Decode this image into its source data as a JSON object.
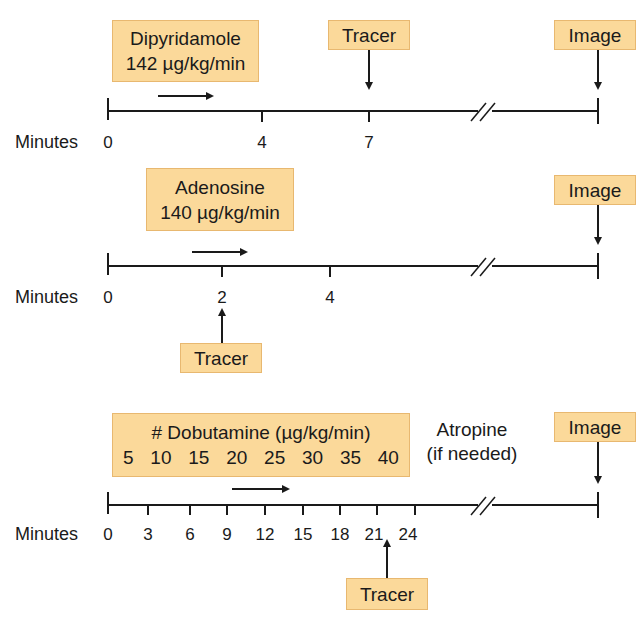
{
  "accent_colors": {
    "box_fill": "#fbd99a",
    "box_border": "#e8b870",
    "line": "#1a1a1a"
  },
  "panels": [
    {
      "name": "dipyridamole",
      "drug_box": {
        "line1": "Dipyridamole",
        "line2": "142 µg/kg/min"
      },
      "axis_label": "Minutes",
      "ticks": [
        "0",
        "4",
        "7"
      ],
      "tracer_label": "Tracer",
      "tracer_at_minute": "7",
      "image_label": "Image"
    },
    {
      "name": "adenosine",
      "drug_box": {
        "line1": "Adenosine",
        "line2": "140 µg/kg/min"
      },
      "axis_label": "Minutes",
      "ticks": [
        "0",
        "2",
        "4"
      ],
      "tracer_label": "Tracer",
      "tracer_at_minute": "2",
      "image_label": "Image"
    },
    {
      "name": "dobutamine",
      "drug_box": {
        "line1": "# Dobutamine (µg/kg/min)",
        "doses": [
          "5",
          "10",
          "15",
          "20",
          "25",
          "30",
          "35",
          "40"
        ]
      },
      "atropine_note": {
        "line1": "Atropine",
        "line2": "(if needed)"
      },
      "axis_label": "Minutes",
      "ticks": [
        "0",
        "3",
        "6",
        "9",
        "12",
        "15",
        "18",
        "21",
        "24"
      ],
      "tracer_label": "Tracer",
      "tracer_at_minute": "22",
      "image_label": "Image"
    }
  ]
}
